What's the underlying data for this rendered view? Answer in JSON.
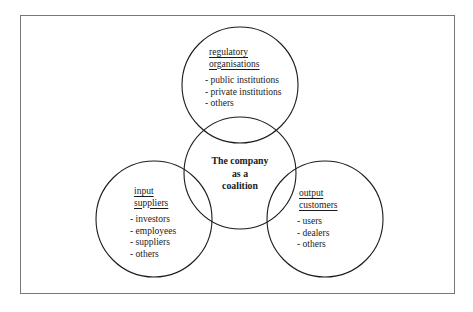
{
  "diagram": {
    "title_text": "",
    "frame": {
      "border_color": "#777777",
      "background_color": "#ffffff"
    },
    "stroke_color": "#1c1c1c",
    "center": {
      "label_lines": [
        "The company",
        "as a",
        "coalition"
      ],
      "line_1": "The company",
      "line_2": "as a",
      "line_3": "coalition"
    },
    "nodes": [
      {
        "id": "regulatory",
        "heading_line_1": "regulatory",
        "heading_line_2": "organisations",
        "items": [
          "- public institutions",
          "- private institutions",
          "- others"
        ],
        "item_1": "- public institutions",
        "item_2": "- private institutions",
        "item_3": "- others"
      },
      {
        "id": "input",
        "heading_line_1": "input",
        "heading_line_2": "suppliers",
        "items": [
          "- investors",
          "- employees",
          "- suppliers",
          "- others"
        ],
        "item_1": "- investors",
        "item_2": "- employees",
        "item_3": "- suppliers",
        "item_4": "- others"
      },
      {
        "id": "output",
        "heading_line_1": "output",
        "heading_line_2": "customers",
        "items": [
          "- users",
          "- dealers",
          "- others"
        ],
        "item_1": "- users",
        "item_2": "- dealers",
        "item_3": "- others"
      }
    ]
  }
}
